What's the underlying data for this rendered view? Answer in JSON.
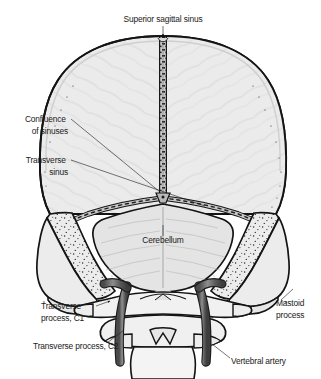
{
  "figure": {
    "view": "posterior",
    "background_color": "#ffffff"
  },
  "palette": {
    "bone_fill": "#e9e9e9",
    "vault_fill": "#ebebeb",
    "cerebellum_fill": "#e4e4e4",
    "vertebra_fill": "#f0f0f0",
    "artery_fill": "#5a5a5a",
    "artery_highlight": "#9a9a9a",
    "sinus_fill": "#cfcfcf",
    "outline": "#1a1a1a",
    "label_text": "#1a1a1a",
    "leader_line": "#1a1a1a"
  },
  "labels": [
    {
      "id": "superior-sagittal-sinus",
      "lines": [
        "Superior sagittal sinus"
      ],
      "anchor": "top-center",
      "text_x": 163,
      "text_y": 22,
      "text_anchor": "middle",
      "leader": "M163,26 L163,36",
      "arrow": true
    },
    {
      "id": "confluence-of-sinuses",
      "lines": [
        "Confluence",
        "of sinuses"
      ],
      "anchor": "left",
      "text_x": 68,
      "text_y": 122,
      "text_anchor": "end",
      "leader": "M71,119 L160,192",
      "arrow": false
    },
    {
      "id": "transverse-sinus",
      "lines": [
        "Transverse",
        "sinus"
      ],
      "anchor": "left",
      "text_x": 68,
      "text_y": 163,
      "text_anchor": "end",
      "leader": "M71,160 L205,206",
      "arrow": false
    },
    {
      "id": "cerebellum",
      "lines": [
        "Cerebellum"
      ],
      "anchor": "center",
      "text_x": 163,
      "text_y": 243,
      "text_anchor": "middle",
      "leader": "M163,225 L163,236",
      "arrow": false
    },
    {
      "id": "mastoid-process",
      "lines": [
        "Mastoid",
        "process"
      ],
      "anchor": "right",
      "text_x": 276,
      "text_y": 306,
      "text_anchor": "start",
      "leader": "M280,300 L292,288",
      "arrow": false
    },
    {
      "id": "transverse-process-c1",
      "lines": [
        "Transverse",
        "process, C1"
      ],
      "anchor": "left",
      "text_x": 41,
      "text_y": 309,
      "text_anchor": "start",
      "leader": "M96,306 L112,300",
      "arrow": true
    },
    {
      "id": "transverse-process-c2",
      "lines": [
        "Transverse process, C2"
      ],
      "anchor": "left-lower",
      "text_x": 41,
      "text_y": 349,
      "text_anchor": "start",
      "leader": "M107,343 L124,329",
      "arrow": false
    },
    {
      "id": "vertebral-artery",
      "lines": [
        "Vertebral artery"
      ],
      "anchor": "right-lower",
      "text_x": 231,
      "text_y": 364,
      "text_anchor": "start",
      "leader": "M230,358 L214,345",
      "arrow": false
    }
  ],
  "structures": [
    {
      "id": "cranial-vault",
      "name": "Cranial vault (occipital/parietal bones)"
    },
    {
      "id": "superior-sagittal-sinus-groove",
      "name": "Superior sagittal sinus"
    },
    {
      "id": "confluence-of-sinuses-node",
      "name": "Confluence of sinuses"
    },
    {
      "id": "transverse-sinus-left",
      "name": "Left transverse sinus"
    },
    {
      "id": "transverse-sinus-right",
      "name": "Right transverse sinus"
    },
    {
      "id": "cerebellum-body",
      "name": "Cerebellum"
    },
    {
      "id": "petrous-temporal-left",
      "name": "Left petrous temporal bone"
    },
    {
      "id": "petrous-temporal-right",
      "name": "Right petrous temporal bone"
    },
    {
      "id": "mastoid-process-left",
      "name": "Left mastoid process"
    },
    {
      "id": "mastoid-process-right",
      "name": "Right mastoid process"
    },
    {
      "id": "atlas-c1",
      "name": "Atlas (C1) with transverse processes"
    },
    {
      "id": "axis-c2",
      "name": "Axis (C2) with transverse processes"
    },
    {
      "id": "vertebral-artery-left",
      "name": "Left vertebral artery"
    },
    {
      "id": "vertebral-artery-right",
      "name": "Right vertebral artery"
    }
  ]
}
